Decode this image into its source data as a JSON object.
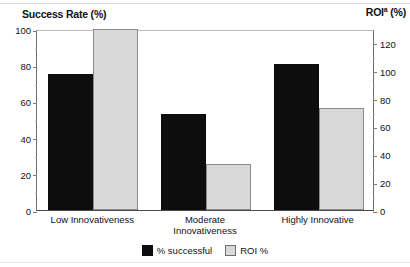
{
  "chart_data": {
    "type": "bar",
    "title": "",
    "categories": [
      "Low Innovativeness",
      "Moderate\nInnovativeness",
      "Highly Innovative"
    ],
    "series": [
      {
        "name": "% successful",
        "axis": "left",
        "color": "#0d0d0d",
        "values": [
          75,
          53,
          80.5
        ]
      },
      {
        "name": "ROI %",
        "axis": "right",
        "color": "#d9d9d9",
        "values": [
          130,
          33,
          73
        ]
      }
    ],
    "left_axis": {
      "label": "Success Rate (%)",
      "ylim": [
        0,
        100
      ],
      "ticks": [
        0,
        20,
        40,
        60,
        80,
        100
      ],
      "tick_labels": [
        "0",
        "20",
        "40",
        "60",
        "80",
        "100"
      ]
    },
    "right_axis": {
      "label": "ROI",
      "label_superscript": "a",
      "label_suffix": " (%)",
      "ylim": [
        0,
        130
      ],
      "ticks": [
        0,
        20,
        40,
        60,
        80,
        100,
        120
      ],
      "tick_labels": [
        "0",
        "20",
        "40",
        "60",
        "80",
        "100",
        "120"
      ]
    },
    "xlabel": "",
    "grid": false,
    "legend_position": "bottom-center"
  },
  "captions": {
    "left": "Success Rate (%)",
    "right_base": "ROI",
    "right_sup": "a",
    "right_suffix": " (%)"
  },
  "legend": {
    "items": [
      {
        "label": "% successful",
        "swatch": "dark"
      },
      {
        "label": "ROI %",
        "swatch": "light"
      }
    ]
  }
}
